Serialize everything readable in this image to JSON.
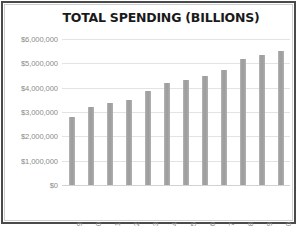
{
  "chart_data": {
    "type": "bar",
    "title": "TOTAL SPENDING (BILLIONS)",
    "xlabel": "",
    "ylabel": "",
    "categories": [
      "2009",
      "2010",
      "2011",
      "2012",
      "2013",
      "2014",
      "2015",
      "2016",
      "2017",
      "2018",
      "2019",
      "2020"
    ],
    "values": [
      2790000,
      3200000,
      3370000,
      3490000,
      3870000,
      4200000,
      4320000,
      4480000,
      4730000,
      5180000,
      5350000,
      5520000
    ],
    "ylim": [
      0,
      6000000
    ],
    "ytick_values": [
      0,
      1000000,
      2000000,
      3000000,
      4000000,
      5000000,
      6000000
    ],
    "ytick_labels": [
      "$0",
      "$1,000,000",
      "$2,000,000",
      "$3,000,000",
      "$4,000,000",
      "$5,000,000",
      "$6,000,000"
    ],
    "grid": true,
    "legend": false,
    "bar_color": "#a3a3a3",
    "gridline_color": "#e3e3e3",
    "axis_label_color": "#8a8a8a",
    "title_color": "#1a1a1a",
    "background_color": "#ffffff",
    "border_color": "#4a4a4a"
  }
}
